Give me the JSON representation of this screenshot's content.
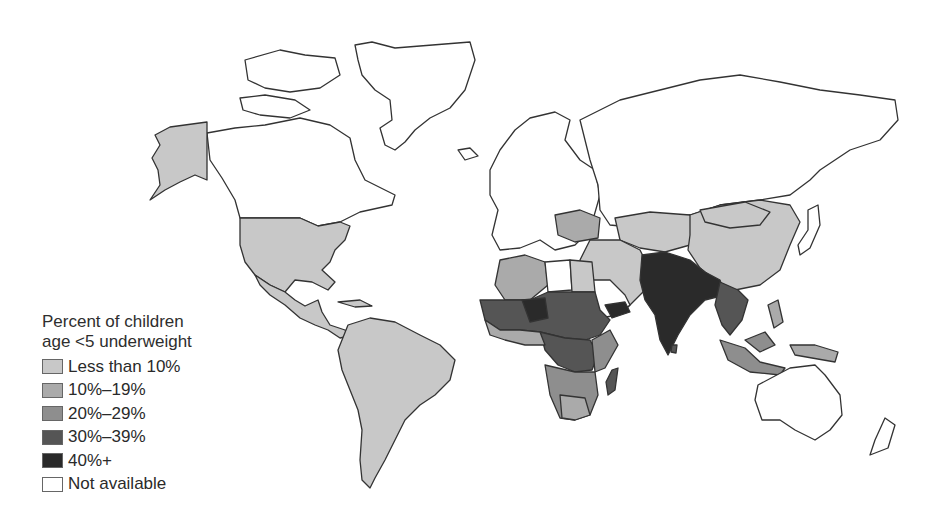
{
  "legend": {
    "title_line1": "Percent of children",
    "title_line2": "age <5 underweight",
    "items": [
      {
        "label": "Less than 10%",
        "color": "#c8c8c8"
      },
      {
        "label": "10%–19%",
        "color": "#aaaaaa"
      },
      {
        "label": "20%–29%",
        "color": "#8e8e8e"
      },
      {
        "label": "30%–39%",
        "color": "#555555"
      },
      {
        "label": "40%+",
        "color": "#2a2a2a"
      },
      {
        "label": "Not available",
        "color": "#ffffff"
      }
    ]
  },
  "regions": {
    "north_america_us": "Less than 10%",
    "alaska": "Less than 10%",
    "canada": "Not available",
    "greenland": "Not available",
    "latin_america": "Less than 10%",
    "europe": "Not available",
    "russia": "Not available",
    "china": "Less than 10%",
    "south_asia": "40%+",
    "sahel_africa": "30%–39%",
    "central_africa": "30%–39%",
    "southern_africa": "20%–29%",
    "madagascar": "30%–39%",
    "southeast_asia": "20%–29%",
    "australia": "Not available"
  }
}
